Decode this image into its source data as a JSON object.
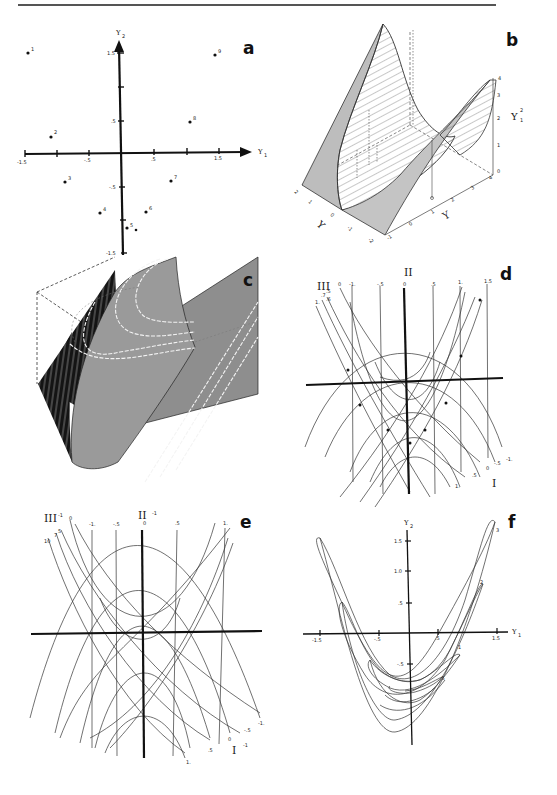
{
  "page": {
    "header_rule": true
  },
  "panels": {
    "a": {
      "label": "a",
      "x_axis_label": "Y",
      "x_axis_sub": "1",
      "y_axis_label": "Y",
      "y_axis_sub": "2",
      "x_ticks": [
        "-1.5",
        "-.5",
        ".5",
        "1.5"
      ],
      "y_ticks": [
        "1.5",
        ".5",
        "-.5",
        "-1.5"
      ],
      "points": [
        {
          "id": "1",
          "x": -1.45,
          "y": 1.5
        },
        {
          "id": "2",
          "x": -1.1,
          "y": 0.25
        },
        {
          "id": "3",
          "x": -0.85,
          "y": -0.45
        },
        {
          "id": "4",
          "x": -0.35,
          "y": -0.9
        },
        {
          "id": "5",
          "x": 0.1,
          "y": -1.15
        },
        {
          "id": "6",
          "x": 0.4,
          "y": -0.9
        },
        {
          "id": "7",
          "x": 0.75,
          "y": -0.45
        },
        {
          "id": "8",
          "x": 1.05,
          "y": 0.5
        },
        {
          "id": "9",
          "x": 1.45,
          "y": 1.5
        }
      ]
    },
    "b": {
      "label": "b",
      "z_axis_label": "Y",
      "z_axis_sup": "2",
      "z_axis_sub": "1",
      "z_ticks": [
        "0",
        "1",
        "2",
        "3",
        "4"
      ],
      "y1_ticks": [
        "2",
        "1",
        "0",
        "-1",
        "-2"
      ],
      "y1_label": "Y",
      "y2_ticks": [
        "-1",
        "0",
        "1",
        "2",
        "3",
        "4"
      ],
      "y2_label": "Y"
    },
    "c": {
      "label": "c"
    },
    "d": {
      "label": "d",
      "family_labels": {
        "top": "II",
        "left": "III",
        "bottom_right": "I"
      },
      "top_values": [
        "0",
        "-1.",
        "-.5",
        "0",
        ".5",
        "1.",
        "1.5"
      ],
      "left_values": [
        "1.",
        ".7",
        ".5",
        ".6"
      ],
      "bottom_values": [
        "1.",
        ".5",
        "0",
        "-.5",
        "-1."
      ]
    },
    "e": {
      "label": "e",
      "family_labels": {
        "top": "II",
        "top_sup": "-1",
        "left": "III",
        "left_sup": "-1",
        "bottom_right": "I",
        "bottom_right_sup": "-1"
      },
      "top_values": [
        "0",
        "-1.",
        "-.5",
        "0",
        ".5",
        "1."
      ],
      "left_values": [
        "10",
        "7",
        "5"
      ],
      "bottom_values": [
        "1.",
        ".5",
        "0",
        "-.5",
        "-1."
      ]
    },
    "f": {
      "label": "f",
      "x_axis_label": "Y",
      "x_axis_sub": "1",
      "y_axis_label": "Y",
      "y_axis_sub": "2",
      "x_ticks": [
        "-1.5",
        "-.5",
        ".5",
        "1.5"
      ],
      "y_ticks": [
        "1.5",
        "1.0",
        ".5",
        "-.5"
      ],
      "contour_labels": [
        "3",
        "2",
        "1",
        ".5"
      ]
    }
  }
}
